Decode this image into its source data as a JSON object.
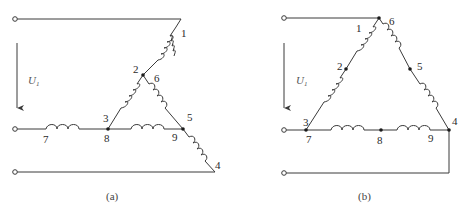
{
  "diagram_a": {
    "caption": "(a)",
    "voltage_label": "U",
    "voltage_subscript": "1",
    "labels": {
      "n1": "1",
      "n2": "2",
      "n3": "3",
      "n4": "4",
      "n5": "5",
      "n6": "6",
      "n7": "7",
      "n8": "8",
      "n9": "9"
    }
  },
  "diagram_b": {
    "caption": "(b)",
    "voltage_label": "U",
    "voltage_subscript": "1",
    "labels": {
      "n1": "1",
      "n2": "2",
      "n3": "3",
      "n4": "4",
      "n5": "5",
      "n6": "6",
      "n7": "7",
      "n8": "8",
      "n9": "9"
    }
  },
  "colors": {
    "line": "#3a3a3a",
    "node": "#1a1a1a",
    "background": "#ffffff"
  }
}
